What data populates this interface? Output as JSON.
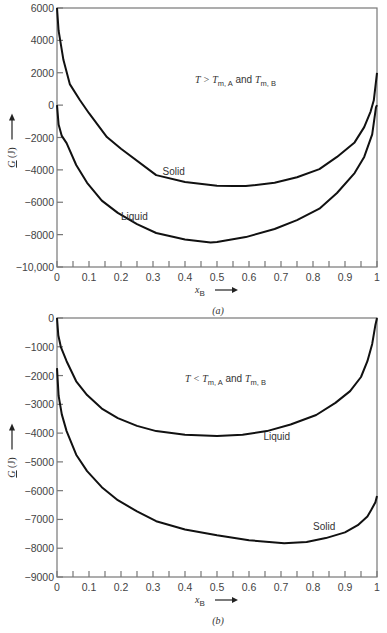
{
  "chart_data": [
    {
      "id": "a",
      "type": "line",
      "caption": "(a)",
      "annotation": {
        "T": "T",
        "op": ">",
        "Tm": "T",
        "sub1": "m, A",
        "and": "and",
        "sub2": "m, B"
      },
      "xlabel": "x",
      "xlabel_sub": "B",
      "ylabel": "G (J)",
      "xlim": [
        0,
        1
      ],
      "ylim": [
        -10000,
        6000
      ],
      "x_ticks": [
        "0",
        "0.1",
        "0.2",
        "0.3",
        "0.4",
        "0.5",
        "0.6",
        "0.7",
        "0.8",
        "0.9",
        "1"
      ],
      "y_ticks": [
        {
          "v": 6000,
          "label": "6000"
        },
        {
          "v": 4000,
          "label": "4000"
        },
        {
          "v": 2000,
          "label": "2000"
        },
        {
          "v": 0,
          "label": "0"
        },
        {
          "v": -2000,
          "label": "-2000"
        },
        {
          "v": -4000,
          "label": "-4000"
        },
        {
          "v": -6000,
          "label": "-6000"
        },
        {
          "v": -8000,
          "label": "-8000"
        },
        {
          "v": -10000,
          "label": "-10,000"
        }
      ],
      "series": [
        {
          "name": "Solid",
          "label_pos": [
            0.33,
            -4300
          ],
          "x": [
            0,
            0.005,
            0.02,
            0.04,
            0.072,
            0.1,
            0.156,
            0.2,
            0.31,
            0.4,
            0.5,
            0.55,
            0.59,
            0.68,
            0.75,
            0.82,
            0.875,
            0.93,
            0.96,
            0.98,
            0.99,
            1.0
          ],
          "y": [
            6000,
            4600,
            2800,
            1300,
            300,
            -500,
            -1975,
            -2700,
            -4320,
            -4750,
            -4980,
            -5000,
            -5000,
            -4800,
            -4450,
            -3950,
            -3200,
            -2300,
            -1360,
            -400,
            300,
            2000
          ]
        },
        {
          "name": "Liquid",
          "label_pos": [
            0.2,
            -7100
          ],
          "x": [
            0,
            0.005,
            0.015,
            0.03,
            0.06,
            0.094,
            0.14,
            0.19,
            0.25,
            0.31,
            0.4,
            0.48,
            0.5,
            0.59,
            0.68,
            0.75,
            0.82,
            0.875,
            0.93,
            0.96,
            0.985,
            0.997,
            1.0
          ],
          "y": [
            0,
            -1200,
            -1900,
            -2345,
            -3700,
            -4800,
            -5900,
            -6660,
            -7350,
            -7900,
            -8300,
            -8480,
            -8450,
            -8150,
            -7650,
            -7100,
            -6400,
            -5430,
            -4200,
            -3200,
            -1800,
            -120,
            0
          ]
        }
      ]
    },
    {
      "id": "b",
      "type": "line",
      "caption": "(b)",
      "annotation": {
        "T": "T",
        "op": "<",
        "Tm": "T",
        "sub1": "m, A",
        "and": "and",
        "sub2": "m, B"
      },
      "xlabel": "x",
      "xlabel_sub": "B",
      "ylabel": "G (J)",
      "xlim": [
        0,
        1
      ],
      "ylim": [
        -9000,
        0
      ],
      "x_ticks": [
        "0",
        "0.1",
        "0.2",
        "0.3",
        "0.4",
        "0.5",
        "0.6",
        "0.7",
        "0.8",
        "0.9",
        "1"
      ],
      "y_ticks": [
        {
          "v": 0,
          "label": "0"
        },
        {
          "v": -1000,
          "label": "-1000"
        },
        {
          "v": -2000,
          "label": "-2000"
        },
        {
          "v": -3000,
          "label": "-3000"
        },
        {
          "v": -4000,
          "label": "-4000"
        },
        {
          "v": -5000,
          "label": "-5000"
        },
        {
          "v": -6000,
          "label": "-6000"
        },
        {
          "v": -7000,
          "label": "-7000"
        },
        {
          "v": -8000,
          "label": "-8000"
        },
        {
          "v": -9000,
          "label": "-9000"
        }
      ],
      "series": [
        {
          "name": "Liquid",
          "label_pos": [
            0.645,
            -4250
          ],
          "x": [
            0,
            0.004,
            0.012,
            0.03,
            0.06,
            0.094,
            0.14,
            0.19,
            0.25,
            0.31,
            0.4,
            0.5,
            0.58,
            0.656,
            0.73,
            0.81,
            0.87,
            0.916,
            0.95,
            0.97,
            0.985,
            0.995,
            1.0
          ],
          "y": [
            0,
            -600,
            -1000,
            -1500,
            -2200,
            -2680,
            -3150,
            -3480,
            -3750,
            -3930,
            -4060,
            -4100,
            -4060,
            -3930,
            -3700,
            -3370,
            -2950,
            -2540,
            -2050,
            -1500,
            -900,
            -240,
            0
          ]
        },
        {
          "name": "Solid",
          "label_pos": [
            0.8,
            -7350
          ],
          "x": [
            0,
            0.005,
            0.015,
            0.03,
            0.06,
            0.094,
            0.14,
            0.19,
            0.25,
            0.31,
            0.4,
            0.5,
            0.6,
            0.71,
            0.78,
            0.84,
            0.9,
            0.94,
            0.97,
            0.98,
            0.995,
            1.0
          ],
          "y": [
            -1740,
            -2700,
            -3350,
            -3930,
            -4750,
            -5320,
            -5880,
            -6330,
            -6720,
            -7060,
            -7350,
            -7550,
            -7720,
            -7830,
            -7780,
            -7650,
            -7450,
            -7200,
            -6900,
            -6710,
            -6400,
            -6190
          ]
        }
      ]
    }
  ]
}
